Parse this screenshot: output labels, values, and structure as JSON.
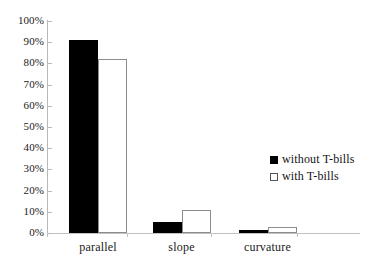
{
  "chart_data": {
    "type": "bar",
    "title": "",
    "subtitle": "",
    "xlabel": "",
    "ylabel": "",
    "categories": [
      "parallel",
      "slope",
      "curvature"
    ],
    "series": [
      {
        "name": "without T-bills",
        "color": "#000000",
        "style": "filled",
        "values": [
          91,
          5,
          1.5
        ]
      },
      {
        "name": "with T-bills",
        "color": "#ffffff",
        "style": "hollow",
        "values": [
          82,
          11,
          3
        ]
      }
    ],
    "ylim": [
      0,
      100
    ],
    "ytick_values": [
      0,
      10,
      20,
      30,
      40,
      50,
      60,
      70,
      80,
      90,
      100
    ],
    "ytick_labels": [
      "0%",
      "10%",
      "20%",
      "30%",
      "40%",
      "50%",
      "60%",
      "70%",
      "80%",
      "90%",
      "100%"
    ],
    "value_suffix": "%",
    "grid": false,
    "legend_position": "center-right",
    "legend_entries": [
      "without T-bills",
      "with T-bills"
    ],
    "annotations": []
  },
  "axes": {
    "y_axis_color": "#b9b9b9",
    "x_axis_color": "#c2c2c2"
  },
  "legend": {
    "items": [
      {
        "label": "without T-bills",
        "swatch": "filled-square-marker"
      },
      {
        "label": "with T-bills",
        "swatch": "hollow-square-marker"
      }
    ]
  }
}
